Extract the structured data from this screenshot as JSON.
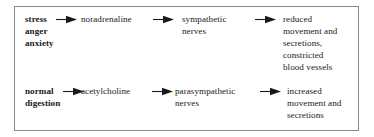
{
  "figure": {
    "kind": "flow-diagram",
    "border_color": "#8a8a8a",
    "background_color": "#ffffff",
    "text_color": "#1a1a1a",
    "arrow_icon_name": "right-arrow-icon"
  },
  "rows": [
    {
      "id": "sympathetic-pathway",
      "stages": [
        {
          "id": "trigger",
          "text": "stress\nanger\nanxiety",
          "bold": true
        },
        {
          "id": "transmitter",
          "text": "noradrenaline",
          "bold": false
        },
        {
          "id": "nerves",
          "text": "sympathetic\nnerves",
          "bold": false
        },
        {
          "id": "effect",
          "text": "reduced\nmovement and\nsecretions,\nconstricted\nblood vessels",
          "bold": false
        }
      ],
      "arrows": [
        {
          "id": "arrow-trigger-to-transmitter"
        },
        {
          "id": "arrow-transmitter-to-nerves"
        },
        {
          "id": "arrow-nerves-to-effect"
        }
      ]
    },
    {
      "id": "parasympathetic-pathway",
      "stages": [
        {
          "id": "trigger",
          "text": "normal\ndigestion",
          "bold": true
        },
        {
          "id": "transmitter",
          "text": "acetylcholine",
          "bold": false
        },
        {
          "id": "nerves",
          "text": "parasympathetic\nnerves",
          "bold": false
        },
        {
          "id": "effect",
          "text": "increased\nmovement and\nsecretions",
          "bold": false
        }
      ],
      "arrows": [
        {
          "id": "arrow-trigger-to-transmitter"
        },
        {
          "id": "arrow-transmitter-to-nerves"
        },
        {
          "id": "arrow-nerves-to-effect"
        }
      ]
    }
  ]
}
